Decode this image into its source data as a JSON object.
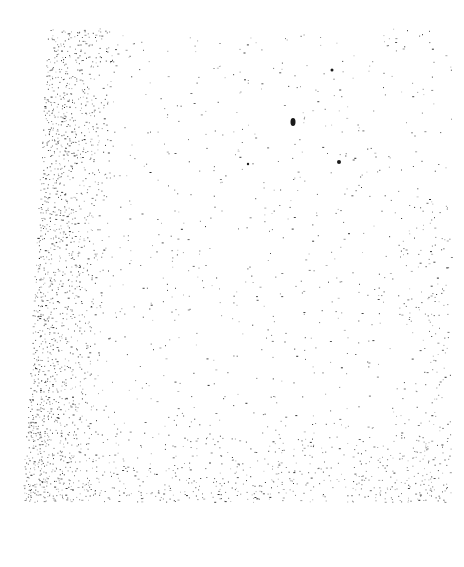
{
  "page": {
    "background": "#ffffff",
    "ink": "#1a1a1a"
  },
  "scan_region": {
    "top_left": [
      48,
      28
    ],
    "top_right": [
      450,
      30
    ],
    "bottom_right": [
      450,
      500
    ],
    "bottom_left": [
      22,
      502
    ]
  },
  "noise": {
    "seed": 1337,
    "base_density": 0.018,
    "left_band_width": 70,
    "left_band_density": 0.22,
    "bottom_band_height": 90,
    "bottom_band_density": 0.12,
    "right_band_width": 60,
    "right_band_density": 0.06,
    "blobs": [
      {
        "x": 293,
        "y": 122,
        "rx": 2.5,
        "ry": 4
      },
      {
        "x": 339,
        "y": 162,
        "rx": 2,
        "ry": 2
      },
      {
        "x": 248,
        "y": 164,
        "rx": 1.2,
        "ry": 1.2
      },
      {
        "x": 332,
        "y": 70,
        "rx": 1.5,
        "ry": 1.5
      }
    ]
  }
}
